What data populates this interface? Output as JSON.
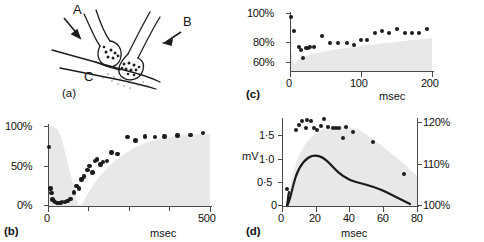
{
  "figure": {
    "panels": [
      "a",
      "b",
      "c",
      "d"
    ]
  },
  "panel_a": {
    "label": "(a)",
    "diagram_labels": {
      "terminal_a": "A",
      "terminal_b": "B",
      "postsynaptic_c": "C"
    },
    "description": "synapse-diagram"
  },
  "panel_b": {
    "label": "(b)",
    "chart_data": {
      "type": "scatter",
      "title": "",
      "xlabel": "msec",
      "ylabel": "",
      "xlim": [
        0,
        500
      ],
      "ylim": [
        0,
        100
      ],
      "xticks": [
        0,
        500
      ],
      "xticklabels": [
        "0",
        "500"
      ],
      "yticks": [
        0,
        50,
        100
      ],
      "yticklabels": [
        "0%",
        "50%",
        "100%"
      ],
      "grid": false,
      "legend": null,
      "points": [
        {
          "x": 3,
          "y": 74
        },
        {
          "x": 8,
          "y": 22
        },
        {
          "x": 11,
          "y": 16
        },
        {
          "x": 14,
          "y": 8
        },
        {
          "x": 18,
          "y": 6
        },
        {
          "x": 22,
          "y": 5
        },
        {
          "x": 27,
          "y": 4
        },
        {
          "x": 32,
          "y": 4
        },
        {
          "x": 38,
          "y": 4
        },
        {
          "x": 44,
          "y": 5
        },
        {
          "x": 52,
          "y": 5
        },
        {
          "x": 60,
          "y": 6
        },
        {
          "x": 70,
          "y": 9
        },
        {
          "x": 80,
          "y": 17
        },
        {
          "x": 88,
          "y": 25
        },
        {
          "x": 95,
          "y": 22
        },
        {
          "x": 103,
          "y": 33
        },
        {
          "x": 112,
          "y": 37
        },
        {
          "x": 122,
          "y": 45
        },
        {
          "x": 128,
          "y": 50
        },
        {
          "x": 137,
          "y": 42
        },
        {
          "x": 146,
          "y": 56
        },
        {
          "x": 152,
          "y": 58
        },
        {
          "x": 162,
          "y": 52
        },
        {
          "x": 170,
          "y": 55
        },
        {
          "x": 182,
          "y": 56
        },
        {
          "x": 196,
          "y": 67
        },
        {
          "x": 215,
          "y": 65
        },
        {
          "x": 245,
          "y": 86
        },
        {
          "x": 270,
          "y": 82
        },
        {
          "x": 300,
          "y": 87
        },
        {
          "x": 330,
          "y": 86
        },
        {
          "x": 360,
          "y": 87
        },
        {
          "x": 400,
          "y": 88
        },
        {
          "x": 440,
          "y": 89
        },
        {
          "x": 478,
          "y": 91
        }
      ],
      "shaded_envelope": true
    }
  },
  "panel_c": {
    "label": "(c)",
    "chart_data": {
      "type": "scatter",
      "title": "",
      "xlabel": "msec",
      "ylabel": "",
      "xlim": [
        0,
        200
      ],
      "ylim": [
        55,
        103
      ],
      "xticks": [
        0,
        100,
        200
      ],
      "xticklabels": [
        "0",
        "100",
        "200"
      ],
      "yticks": [
        60,
        80,
        100
      ],
      "yticklabels": [
        "60%",
        "80%",
        "100%"
      ],
      "grid": false,
      "legend": null,
      "points": [
        {
          "x": 2,
          "y": 100
        },
        {
          "x": 6,
          "y": 88
        },
        {
          "x": 13,
          "y": 75
        },
        {
          "x": 16,
          "y": 73
        },
        {
          "x": 19,
          "y": 66
        },
        {
          "x": 22,
          "y": 74
        },
        {
          "x": 25,
          "y": 74
        },
        {
          "x": 28,
          "y": 75
        },
        {
          "x": 34,
          "y": 75
        },
        {
          "x": 45,
          "y": 84
        },
        {
          "x": 57,
          "y": 78
        },
        {
          "x": 68,
          "y": 78
        },
        {
          "x": 80,
          "y": 78
        },
        {
          "x": 90,
          "y": 77
        },
        {
          "x": 100,
          "y": 81
        },
        {
          "x": 108,
          "y": 81
        },
        {
          "x": 120,
          "y": 87
        },
        {
          "x": 130,
          "y": 88
        },
        {
          "x": 140,
          "y": 87
        },
        {
          "x": 150,
          "y": 90
        },
        {
          "x": 162,
          "y": 87
        },
        {
          "x": 172,
          "y": 87
        },
        {
          "x": 182,
          "y": 87
        },
        {
          "x": 193,
          "y": 90
        }
      ],
      "shaded_envelope": true
    }
  },
  "panel_d": {
    "label": "(d)",
    "chart_data": {
      "type": "scatter",
      "title": "",
      "xlabel": "msec",
      "ylabel": "mV",
      "xlim": [
        0,
        80
      ],
      "ylim": [
        0,
        1.75
      ],
      "xticks": [
        0,
        20,
        40,
        60,
        80
      ],
      "xticklabels": [
        "0",
        "20",
        "40",
        "60",
        "80"
      ],
      "yticks": [
        0,
        0.5,
        1.0,
        1.5
      ],
      "yticklabels": [
        "0",
        "0·5",
        "1·0",
        "1·5"
      ],
      "y2label": "",
      "y2lim": [
        100,
        122
      ],
      "y2ticks": [
        100,
        110,
        120
      ],
      "y2ticklabels": [
        "100%",
        "110%",
        "120%"
      ],
      "grid": false,
      "legend": null,
      "points": [
        {
          "x": 3,
          "y": 0.34
        },
        {
          "x": 8,
          "y": 1.52
        },
        {
          "x": 10,
          "y": 1.62
        },
        {
          "x": 12,
          "y": 1.7
        },
        {
          "x": 14,
          "y": 1.56
        },
        {
          "x": 15,
          "y": 1.72
        },
        {
          "x": 17,
          "y": 1.7
        },
        {
          "x": 19,
          "y": 1.55
        },
        {
          "x": 21,
          "y": 1.52
        },
        {
          "x": 23,
          "y": 1.6
        },
        {
          "x": 25,
          "y": 1.74
        },
        {
          "x": 27,
          "y": 1.58
        },
        {
          "x": 30,
          "y": 1.55
        },
        {
          "x": 32,
          "y": 1.55
        },
        {
          "x": 34,
          "y": 1.56
        },
        {
          "x": 36,
          "y": 1.35
        },
        {
          "x": 38,
          "y": 1.58
        },
        {
          "x": 42,
          "y": 1.47
        },
        {
          "x": 54,
          "y": 1.28
        },
        {
          "x": 72,
          "y": 0.64
        }
      ],
      "curve": [
        {
          "x": 3,
          "y": 0.0
        },
        {
          "x": 6,
          "y": 0.2
        },
        {
          "x": 9,
          "y": 0.43
        },
        {
          "x": 12,
          "y": 0.6
        },
        {
          "x": 16,
          "y": 0.7
        },
        {
          "x": 20,
          "y": 0.74
        },
        {
          "x": 26,
          "y": 0.71
        },
        {
          "x": 32,
          "y": 0.64
        },
        {
          "x": 40,
          "y": 0.55
        },
        {
          "x": 50,
          "y": 0.47
        },
        {
          "x": 58,
          "y": 0.44
        },
        {
          "x": 66,
          "y": 0.38
        },
        {
          "x": 73,
          "y": 0.3
        },
        {
          "x": 80,
          "y": 0.18
        }
      ],
      "shaded_envelope": true
    }
  }
}
